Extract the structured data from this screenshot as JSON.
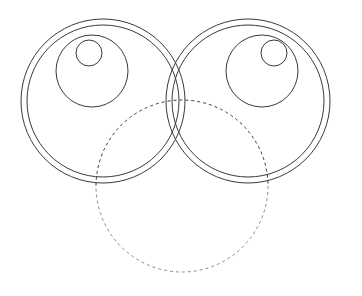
{
  "figure": {
    "canvas": {
      "width": 362,
      "height": 296,
      "background": "#ffffff"
    },
    "colors": {
      "solid_stroke": "#3a3a3a",
      "dashed_stroke": "#8a8a8a",
      "fill": "none"
    },
    "stroke_width": 1,
    "dash_pattern": "3 3"
  },
  "chart_data": {
    "type": "scatter",
    "xlabel": "",
    "ylabel": "",
    "xlim": [
      0,
      362
    ],
    "ylim": [
      0,
      296
    ],
    "grid": false,
    "legend": "none",
    "shapes": [
      {
        "name": "left-outer-ring",
        "shape": "circle",
        "cx": 103,
        "cy": 101,
        "r": 82,
        "style": "solid",
        "stroke": "#3a3a3a",
        "fill": "none"
      },
      {
        "name": "left-inner-ring",
        "shape": "circle",
        "cx": 103,
        "cy": 101,
        "r": 76,
        "style": "solid",
        "stroke": "#3a3a3a",
        "fill": "none"
      },
      {
        "name": "left-medium-circle",
        "shape": "circle",
        "cx": 92,
        "cy": 71,
        "r": 36,
        "style": "solid",
        "stroke": "#3a3a3a",
        "fill": "none"
      },
      {
        "name": "left-small-circle",
        "shape": "circle",
        "cx": 89,
        "cy": 53,
        "r": 13,
        "style": "solid",
        "stroke": "#3a3a3a",
        "fill": "none"
      },
      {
        "name": "right-outer-ring",
        "shape": "circle",
        "cx": 248,
        "cy": 101,
        "r": 82,
        "style": "solid",
        "stroke": "#3a3a3a",
        "fill": "none"
      },
      {
        "name": "right-inner-ring",
        "shape": "circle",
        "cx": 248,
        "cy": 101,
        "r": 76,
        "style": "solid",
        "stroke": "#3a3a3a",
        "fill": "none"
      },
      {
        "name": "right-medium-circle",
        "shape": "circle",
        "cx": 262,
        "cy": 71,
        "r": 36,
        "style": "solid",
        "stroke": "#3a3a3a",
        "fill": "none"
      },
      {
        "name": "right-small-circle",
        "shape": "circle",
        "cx": 274,
        "cy": 53,
        "r": 13,
        "style": "solid",
        "stroke": "#3a3a3a",
        "fill": "none"
      },
      {
        "name": "bottom-circle-solid-arc",
        "shape": "arc",
        "cx": 182,
        "cy": 186,
        "r": 86,
        "start_deg": 172,
        "end_deg": 8,
        "sweep": "clockwise-lower",
        "style": "solid",
        "stroke": "#3a3a3a",
        "fill": "none"
      },
      {
        "name": "bottom-circle-dashed-arc",
        "shape": "arc",
        "cx": 182,
        "cy": 186,
        "r": 86,
        "start_deg": 188,
        "end_deg": 352,
        "sweep": "counterclockwise-upper",
        "style": "dashed",
        "stroke": "#8a8a8a",
        "fill": "none"
      }
    ]
  }
}
